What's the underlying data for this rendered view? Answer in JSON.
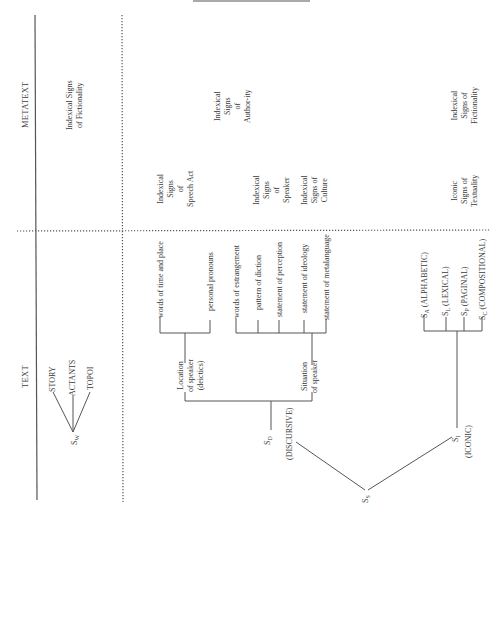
{
  "headers": {
    "metatext": "METATEXT",
    "text": "TEXT"
  },
  "metatext": {
    "fictionality_top": [
      "Indexical Signs",
      "of Fictionality"
    ],
    "authority": [
      "Indexical",
      "Signs",
      "of",
      "Author-ity"
    ],
    "fictionality_right": [
      "Indexical",
      "Signs of",
      "Fictionality"
    ],
    "speech_act": [
      "Indexical",
      "Signs",
      "of",
      "Speech Act"
    ],
    "speaker": [
      "Indexical",
      "Signs",
      "of",
      "Speaker"
    ],
    "culture": [
      "Indexical",
      "Signs of",
      "Culture"
    ],
    "textuality": [
      "Iconic",
      "Signs of",
      "Textuality"
    ]
  },
  "world_tree": {
    "root": "S",
    "root_sub": "W",
    "children": [
      "STORY",
      "ACTANTS",
      "TOPOI"
    ]
  },
  "discursive": {
    "node": "S",
    "node_sub": "D",
    "label": "(DISCURSIVE)",
    "location": {
      "label": [
        "Location",
        "of speaker",
        "(deictics)"
      ],
      "leaves": [
        "words of time and place",
        "personal pronouns"
      ]
    },
    "situation": {
      "label": [
        "Situation",
        "of speaker"
      ],
      "leaves": [
        "words of estrangement",
        "pattern of diction",
        "statement of perception",
        "statement of ideology",
        "statement of metalanguage"
      ]
    }
  },
  "iconic": {
    "node": "S",
    "node_sub": "I",
    "label": "(ICONIC)",
    "leaves": [
      {
        "s": "S",
        "sub": "A",
        "label": "(ALPHABETIC)"
      },
      {
        "s": "S",
        "sub": "L",
        "label": "(LEXICAL)"
      },
      {
        "s": "S",
        "sub": "P",
        "label": "(PAGINAL)"
      },
      {
        "s": "S",
        "sub": "C",
        "label": "(COMPOSITIONAL)"
      }
    ]
  },
  "root": {
    "s": "S",
    "sub": "S"
  }
}
